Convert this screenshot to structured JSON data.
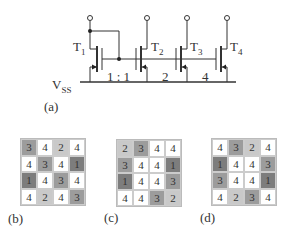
{
  "circuit": {
    "label": "(a)",
    "supply": {
      "main": "V",
      "sub": "SS"
    },
    "transistors": [
      {
        "name": "T",
        "sub": "1"
      },
      {
        "name": "T",
        "sub": "2"
      },
      {
        "name": "T",
        "sub": "3"
      },
      {
        "name": "T",
        "sub": "4"
      }
    ],
    "ratios": [
      "1 : 1",
      "2",
      "4"
    ]
  },
  "colors": {
    "1": "#7d7d7d",
    "2": "#c9c9c9",
    "3": "#9c9c9c",
    "4": "#ffffff"
  },
  "grids": [
    {
      "label": "(b)",
      "cells": [
        [
          3,
          4,
          2,
          4
        ],
        [
          4,
          3,
          4,
          1
        ],
        [
          1,
          4,
          3,
          4
        ],
        [
          4,
          2,
          4,
          3
        ]
      ]
    },
    {
      "label": "(c)",
      "cells": [
        [
          2,
          3,
          4,
          4
        ],
        [
          3,
          4,
          4,
          1
        ],
        [
          1,
          4,
          4,
          3
        ],
        [
          4,
          4,
          3,
          2
        ]
      ]
    },
    {
      "label": "(d)",
      "cells": [
        [
          4,
          3,
          2,
          4
        ],
        [
          1,
          4,
          4,
          3
        ],
        [
          3,
          4,
          4,
          1
        ],
        [
          4,
          2,
          3,
          4
        ]
      ]
    }
  ]
}
